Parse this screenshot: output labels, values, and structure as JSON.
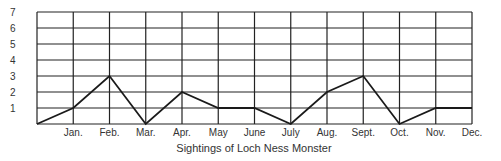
{
  "chart_data": {
    "type": "line",
    "title": "Sightings of Loch Ness Monster",
    "xlabel": "Sightings of Loch Ness Monster",
    "ylabel": "",
    "categories": [
      "Jan.",
      "Feb.",
      "Mar.",
      "Apr.",
      "May",
      "June",
      "July",
      "Aug.",
      "Sept.",
      "Oct.",
      "Nov.",
      "Dec."
    ],
    "start_value": 0,
    "series": [
      {
        "name": "Sightings",
        "values": [
          1,
          3,
          0,
          2,
          1,
          1,
          0,
          2,
          3,
          0,
          1,
          1
        ]
      }
    ],
    "y_ticks": [
      "1",
      "2",
      "3",
      "4",
      "5",
      "6",
      "7"
    ],
    "ylim": [
      0,
      7
    ],
    "grid": true,
    "legend": "none",
    "colors": {
      "line": "#1a1a1a",
      "grid": "#222222"
    }
  }
}
